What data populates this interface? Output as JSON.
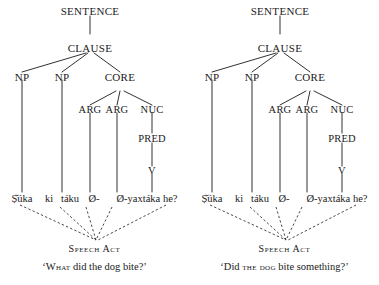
{
  "figure": {
    "type": "rrg-syntax-tree-pair",
    "background_color": "#ffffff",
    "line_color": "#1a1a1a",
    "text_color": "#1a1a1a"
  },
  "tree_nodes": {
    "sentence": "SENTENCE",
    "clause": "CLAUSE",
    "np1": "NP",
    "np2": "NP",
    "core": "CORE",
    "arg1": "ARG",
    "arg2": "ARG",
    "nuc": "NUC",
    "pred": "PRED",
    "v": "V"
  },
  "terminals": {
    "t1": "Ṣ̌úka",
    "t2": "ki",
    "t3": "táku",
    "t4": "Ø-",
    "t5": "Ø-yaxtáka he?"
  },
  "terminal_line_plain": "Ṣ̌úka ki táku   Ø-   Ø-yaxtáka he?",
  "speech_act_label": "Speech Act",
  "left": {
    "gloss_open_quote": "‘",
    "gloss_smallcaps": "What",
    "gloss_rest": " did the dog bite?",
    "gloss_close_quote": "’",
    "gloss_full": "‘What did the dog bite?’"
  },
  "right": {
    "gloss_open_quote": "‘",
    "gloss_pre": "Did ",
    "gloss_smallcaps": "the dog",
    "gloss_rest": " bite something?",
    "gloss_close_quote": "’",
    "gloss_full": "‘Did the dog bite something?’"
  }
}
